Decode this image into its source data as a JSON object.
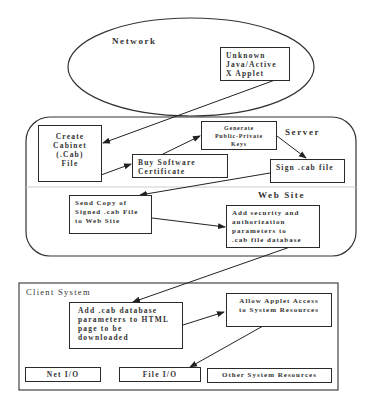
{
  "diagram": {
    "regions": {
      "network": {
        "label": "Network"
      },
      "server": {
        "label": "Server"
      },
      "website": {
        "label": "Web Site"
      },
      "client": {
        "label": "Client System"
      }
    },
    "nodes": {
      "unknown_applet": "Unknown\nJava/Active\nX Applet",
      "create_cab": "Create\nCabinet\n(.Cab)\nFile",
      "buy_cert": "Buy Software\nCertificate",
      "generate_keys": "Generate\nPublic-Private\nKeys",
      "sign_cab": "Sign .cab file",
      "send_copy": "Send Copy of\nSigned .cab File\nto Web Site",
      "add_security": "Add security and\nauthorization\nparameters to\n.cab file database",
      "add_cab_params": "Add .cab database\nparameters to HTML\npage to be\ndownloaded",
      "allow_access": "Allow Applet Access\nto System Resources",
      "net_io": "Net I/O",
      "file_io": "File I/O",
      "other_resources": "Other System Resources"
    },
    "edges": [
      {
        "from": "unknown_applet",
        "to": "create_cab"
      },
      {
        "from": "create_cab",
        "to": "buy_cert"
      },
      {
        "from": "buy_cert",
        "to": "generate_keys"
      },
      {
        "from": "generate_keys",
        "to": "sign_cab"
      },
      {
        "from": "sign_cab",
        "to": "send_copy"
      },
      {
        "from": "send_copy",
        "to": "add_security"
      },
      {
        "from": "add_security",
        "to": "add_cab_params"
      },
      {
        "from": "add_cab_params",
        "to": "allow_access"
      },
      {
        "from": "allow_access",
        "to": "file_io"
      }
    ]
  }
}
